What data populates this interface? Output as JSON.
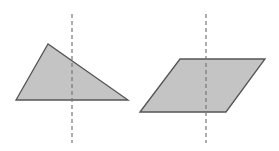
{
  "figure": {
    "colors": {
      "fill": "#c4c4c4",
      "stroke": "#555555",
      "dashed_line": "#777777",
      "background": "#ffffff"
    },
    "shapes": [
      {
        "name": "triangle",
        "type": "scalene-triangle"
      },
      {
        "name": "parallelogram",
        "type": "parallelogram"
      }
    ]
  }
}
